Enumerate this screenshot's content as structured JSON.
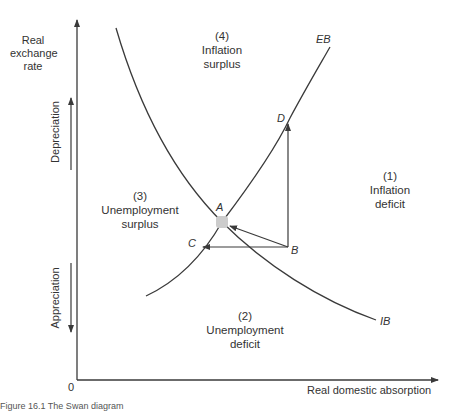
{
  "axes": {
    "y_label": [
      "Real",
      "exchange",
      "rate"
    ],
    "x_label": "Real domestic absorption",
    "origin": "0",
    "y_up_direction": "Depreciation",
    "y_down_direction": "Appreciation"
  },
  "curves": {
    "eb": "EB",
    "ib": "IB"
  },
  "points": {
    "a": "A",
    "b": "B",
    "c": "C",
    "d": "D"
  },
  "regions": [
    {
      "num": "(1)",
      "line1": "Inflation",
      "line2": "deficit"
    },
    {
      "num": "(2)",
      "line1": "Unemployment",
      "line2": "deficit"
    },
    {
      "num": "(3)",
      "line1": "Unemployment",
      "line2": "surplus"
    },
    {
      "num": "(4)",
      "line1": "Inflation",
      "line2": "surplus"
    }
  ],
  "caption": "Figure 16.1  The Swan diagram",
  "colors": {
    "line": "#3a3a3a",
    "equilibrium": "#cccccc"
  }
}
